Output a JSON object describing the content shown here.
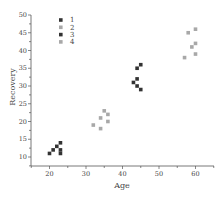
{
  "chart_data": {
    "type": "scatter",
    "title": "",
    "xlabel": "Age",
    "ylabel": "Recovery",
    "xlim": [
      15,
      65
    ],
    "ylim": [
      7,
      50
    ],
    "xticks": [
      20,
      30,
      40,
      50,
      60
    ],
    "yticks": [
      10,
      15,
      20,
      25,
      30,
      35,
      40,
      45,
      50
    ],
    "grid": false,
    "legend_position": "upper-left",
    "series": [
      {
        "name": "1",
        "color": "#333333",
        "points": [
          [
            20,
            11
          ],
          [
            21,
            12
          ],
          [
            22,
            13
          ],
          [
            23,
            14
          ],
          [
            23,
            12
          ],
          [
            23,
            11
          ]
        ]
      },
      {
        "name": "2",
        "color": "#a8a8a8",
        "points": [
          [
            32,
            19
          ],
          [
            34,
            21
          ],
          [
            34,
            18
          ],
          [
            35,
            23
          ],
          [
            36,
            22
          ],
          [
            36,
            20
          ]
        ]
      },
      {
        "name": "3",
        "color": "#333333",
        "points": [
          [
            43,
            31
          ],
          [
            44,
            32
          ],
          [
            44,
            30
          ],
          [
            44,
            35
          ],
          [
            45,
            36
          ],
          [
            45,
            29
          ]
        ]
      },
      {
        "name": "4",
        "color": "#a8a8a8",
        "points": [
          [
            57,
            38
          ],
          [
            58,
            45
          ],
          [
            59,
            41
          ],
          [
            60,
            46
          ],
          [
            60,
            42
          ],
          [
            60,
            39
          ]
        ]
      }
    ]
  }
}
